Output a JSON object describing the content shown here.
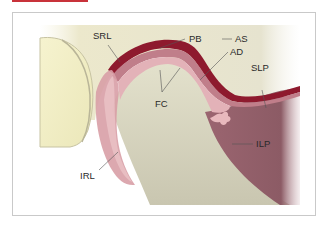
{
  "figure": {
    "tab_color": "#c8323a",
    "labels": [
      {
        "id": "SRL",
        "text": "SRL"
      },
      {
        "id": "PB",
        "text": "PB"
      },
      {
        "id": "AS",
        "text": "AS"
      },
      {
        "id": "AD",
        "text": "AD"
      },
      {
        "id": "SLP",
        "text": "SLP"
      },
      {
        "id": "FC",
        "text": "FC"
      },
      {
        "id": "ILP",
        "text": "ILP"
      },
      {
        "id": "IRL",
        "text": "IRL"
      }
    ],
    "colors": {
      "background_bone": "#e9e6c9",
      "condyle_left": "#f2efc8",
      "disc_dark": "#8e1a2e",
      "disc_mid": "#b56a78",
      "disc_light": "#e4b3b8",
      "muscle": "#8f5a64",
      "lower_bone": "#d9d6bf"
    }
  }
}
